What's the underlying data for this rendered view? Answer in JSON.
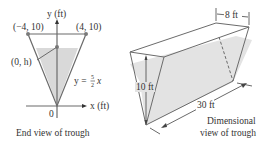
{
  "end_view": {
    "y_axis_label": "y (ft)",
    "x_axis_label": "x (ft)",
    "origin_label": "0",
    "left_point_label": "(−4, 10)",
    "right_point_label": "(4, 10)",
    "water_point_label": "(0, h)",
    "equation_lhs": "y =",
    "equation_num": "5",
    "equation_den": "2",
    "equation_var": "x",
    "caption": "End view of trough"
  },
  "dimensional_view": {
    "width_label": "8 ft",
    "height_label": "10 ft",
    "length_label": "30 ft",
    "caption_line1": "Dimensional",
    "caption_line2": "view of trough"
  },
  "colors": {
    "line": "#6b6b6b",
    "water": "#d9d9d9",
    "point": "#7a7a7a",
    "text": "#333333"
  }
}
